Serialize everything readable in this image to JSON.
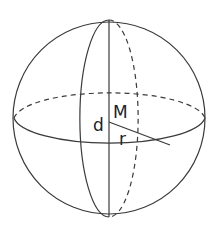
{
  "diagram": {
    "type": "sphere",
    "labels": {
      "center": "M",
      "diameter": "d",
      "radius": "r"
    },
    "colors": {
      "stroke": "#3a3a3a",
      "text": "#222222",
      "background": "#ffffff"
    }
  }
}
